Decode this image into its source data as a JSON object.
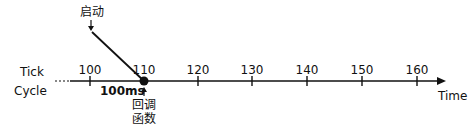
{
  "row_labels": {
    "tick": "Tick",
    "cycle": "Cycle"
  },
  "start_label": "启动",
  "callback_label": [
    "回调",
    "函数"
  ],
  "interval_label": "100ms",
  "axis_label": "Time",
  "ticks": [
    "100",
    "110",
    "120",
    "130",
    "140",
    "150",
    "160"
  ],
  "colors": {
    "line": "#111111",
    "background": "#ffffff"
  }
}
